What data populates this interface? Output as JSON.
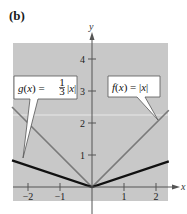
{
  "panel_label": "(b)",
  "chart_data": {
    "type": "line",
    "title": "",
    "xlabel": "x",
    "ylabel": "y",
    "xlim": [
      -2.5,
      2.4
    ],
    "ylim": [
      -0.45,
      4.5
    ],
    "xticks": [
      -2,
      -1,
      1,
      2
    ],
    "xtick_labels": [
      "−2",
      "−1",
      "1",
      "2"
    ],
    "yticks": [
      1,
      2,
      3,
      4
    ],
    "ytick_labels": [
      "1",
      "2",
      "3",
      "4"
    ],
    "grid": false,
    "background": "#c8c8c8",
    "series": [
      {
        "name": "f(x) = |x|",
        "label_main": "f(x) = ",
        "label_abs": "|x|",
        "color": "#7a7a7a",
        "x": [
          -2.5,
          0,
          2.4
        ],
        "y": [
          2.5,
          0,
          2.4
        ]
      },
      {
        "name": "g(x) = 1/3 |x|",
        "label_main": "g(x) = ",
        "label_frac_num": "1",
        "label_frac_den": "3",
        "label_abs": "|x|",
        "color": "#111111",
        "x": [
          -2.5,
          0,
          2.4
        ],
        "y": [
          0.833,
          0,
          0.8
        ]
      }
    ],
    "annotations": [
      {
        "text": "g(x) = 1/3 |x|",
        "points_to": [
          -2.2,
          0.73
        ]
      },
      {
        "text": "f(x) = |x|",
        "points_to": [
          2.1,
          2.1
        ]
      }
    ]
  }
}
